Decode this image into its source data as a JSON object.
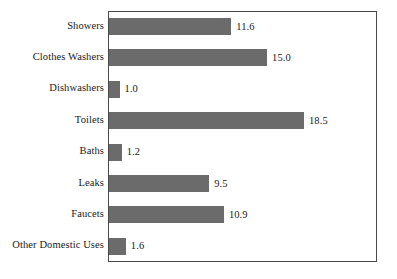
{
  "chart_data": {
    "type": "bar",
    "orientation": "horizontal",
    "title": "",
    "subtitle": "",
    "xlabel": "",
    "ylabel": "",
    "categories": [
      "Showers",
      "Clothes Washers",
      "Dishwashers",
      "Toilets",
      "Baths",
      "Leaks",
      "Faucets",
      "Other Domestic Uses"
    ],
    "values": [
      11.6,
      15.0,
      1.0,
      18.5,
      1.2,
      9.5,
      10.9,
      1.6
    ],
    "value_labels": [
      "11.6",
      "15.0",
      "1.0",
      "18.5",
      "1.2",
      "9.5",
      "10.9",
      "1.6"
    ],
    "xlim": [
      0,
      25.6
    ],
    "grid": false,
    "legend": null,
    "axis_ticks_visible": false,
    "bar_color": "#6b6b6b",
    "frame_color": "#4a4a4a",
    "background_color": "#ffffff",
    "text_color": "#1a1a1a"
  },
  "layout": {
    "pixels_per_unit": 10.54,
    "bar_height_px": 17,
    "row_pitch_px": 31.4,
    "first_row_top_px": 6
  }
}
